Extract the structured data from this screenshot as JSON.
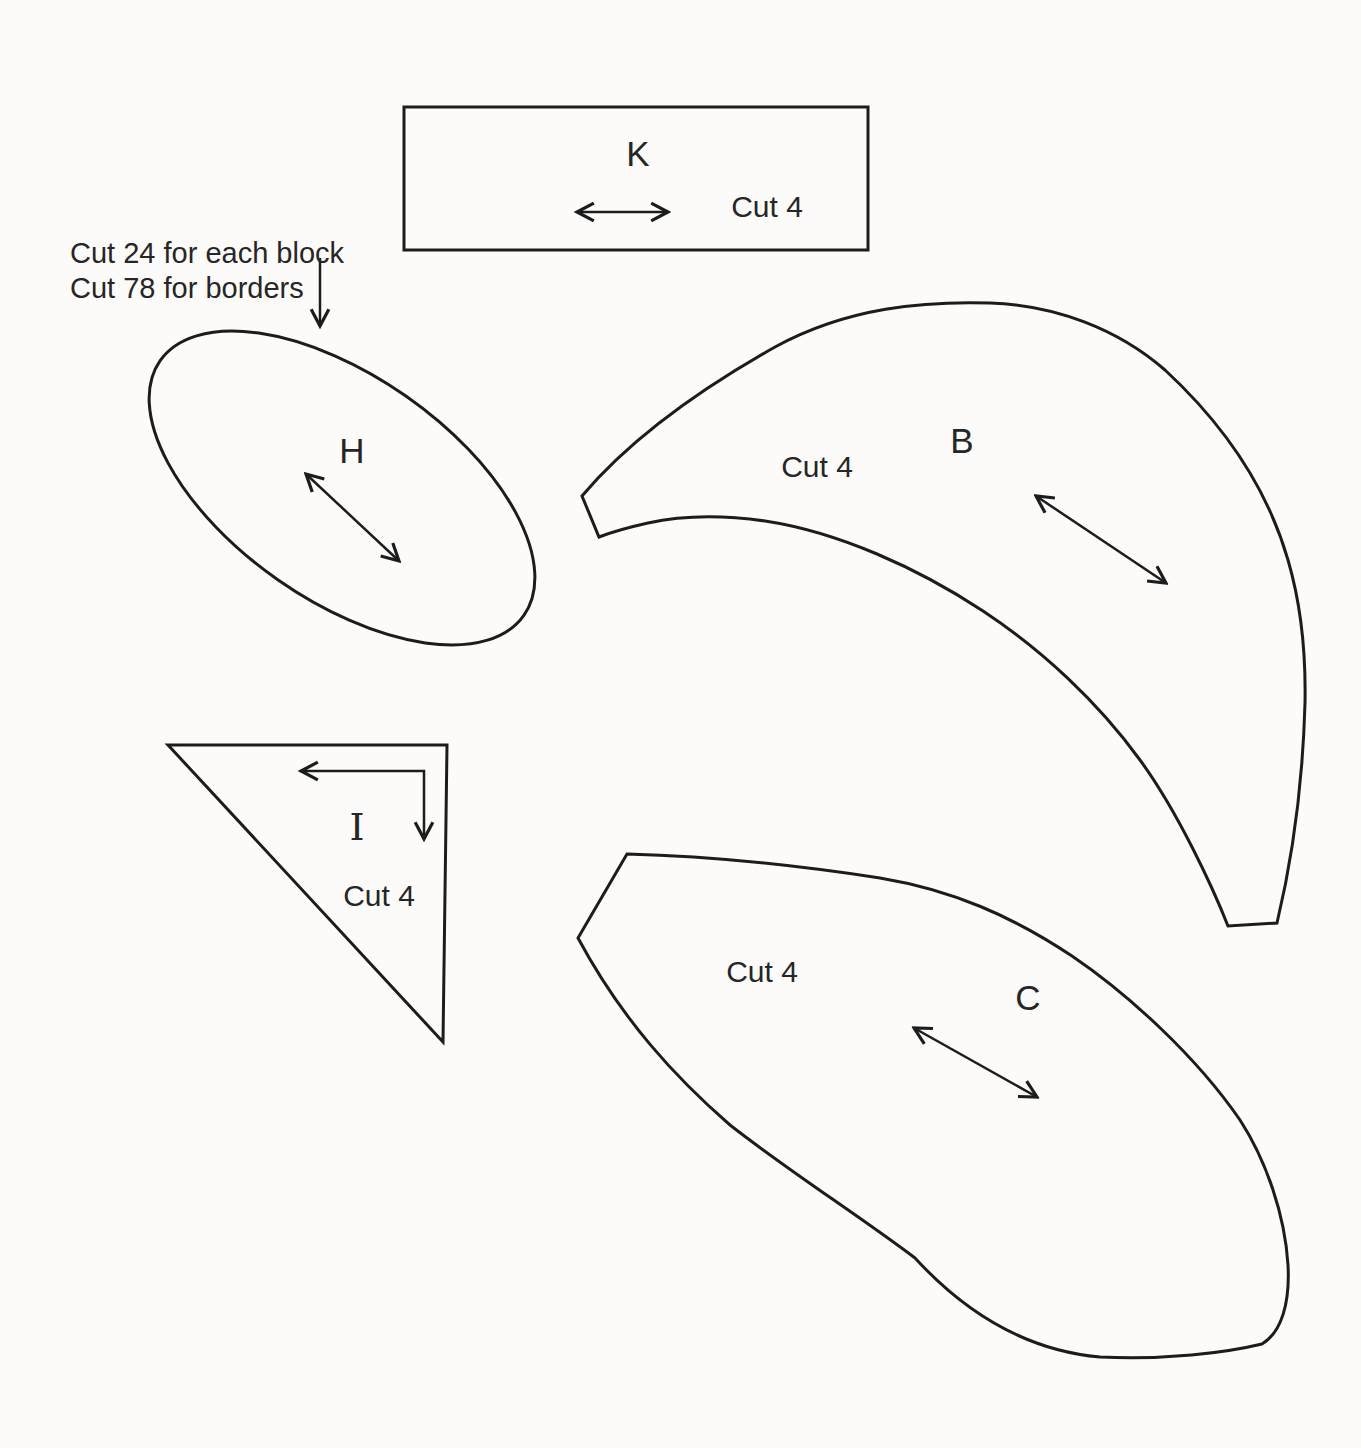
{
  "page": {
    "background_color": "#fcfbf9",
    "line_color": "#1c1c1c",
    "text_color": "#262626"
  },
  "pieces": {
    "k": {
      "label": "K",
      "cut_label": "Cut 4"
    },
    "h": {
      "label": "H",
      "note_line_1": "Cut 24 for each block",
      "note_line_2": "Cut 78 for borders"
    },
    "b": {
      "label": "B",
      "cut_label": "Cut 4"
    },
    "i": {
      "label": "I",
      "cut_label": "Cut 4"
    },
    "c": {
      "label": "C",
      "cut_label": "Cut 4"
    }
  }
}
